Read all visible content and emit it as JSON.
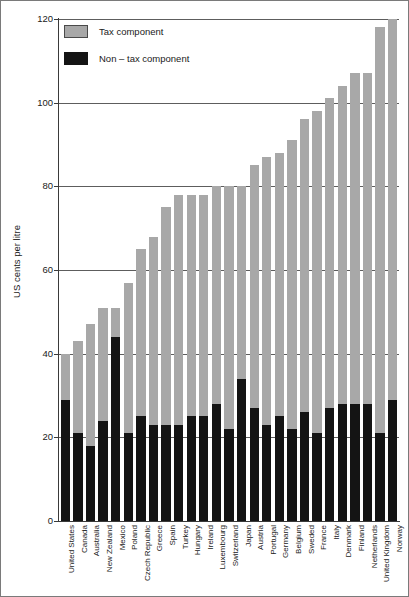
{
  "chart_data": {
    "type": "bar",
    "stacked": true,
    "title": "",
    "xlabel": "",
    "ylabel": "US cents per litre",
    "ylim": [
      0,
      120
    ],
    "yticks": [
      0,
      20,
      40,
      60,
      80,
      100,
      120
    ],
    "ytick_labels": [
      "0",
      "20",
      "40",
      "60",
      "80",
      "100",
      "120"
    ],
    "grid": true,
    "grid_axis": "y",
    "legend_position": "top-left",
    "categories": [
      "United States",
      "Canada",
      "Australia",
      "New Zealand",
      "Mexico",
      "Poland",
      "Czech Republic",
      "Greece",
      "Spain",
      "Turkey",
      "Hungary",
      "Ireland",
      "Luxembourg",
      "Switzerland",
      "Japan",
      "Austria",
      "Portugal",
      "Germany",
      "Belgium",
      "Sweded",
      "France",
      "Italy",
      "Denmark",
      "Finland",
      "Netherlands",
      "United Kingdom",
      "Norway"
    ],
    "series": [
      {
        "name": "Non – tax component",
        "color": "#141414",
        "values": [
          29,
          21,
          18,
          24,
          44,
          21,
          25,
          23,
          23,
          23,
          25,
          25,
          28,
          22,
          34,
          27,
          23,
          25,
          22,
          26,
          21,
          27,
          28,
          28,
          28,
          21,
          29
        ]
      },
      {
        "name": "Tax component",
        "color": "#a8a8a8",
        "values": [
          11,
          22,
          29,
          27,
          7,
          36,
          40,
          45,
          52,
          55,
          53,
          53,
          52,
          58,
          46,
          58,
          64,
          63,
          69,
          70,
          77,
          74,
          76,
          79,
          79,
          97,
          91
        ]
      }
    ],
    "totals": [
      40,
      43,
      47,
      51,
      51,
      57,
      65,
      68,
      75,
      78,
      78,
      78,
      80,
      80,
      80,
      85,
      87,
      88,
      91,
      96,
      98,
      101,
      104,
      107,
      107,
      118,
      120
    ]
  },
  "legend": {
    "items": [
      {
        "label": "Tax component",
        "color": "#a8a8a8"
      },
      {
        "label": "Non – tax component",
        "color": "#141414"
      }
    ]
  },
  "axis": {
    "y_title": "US cents per litre"
  }
}
